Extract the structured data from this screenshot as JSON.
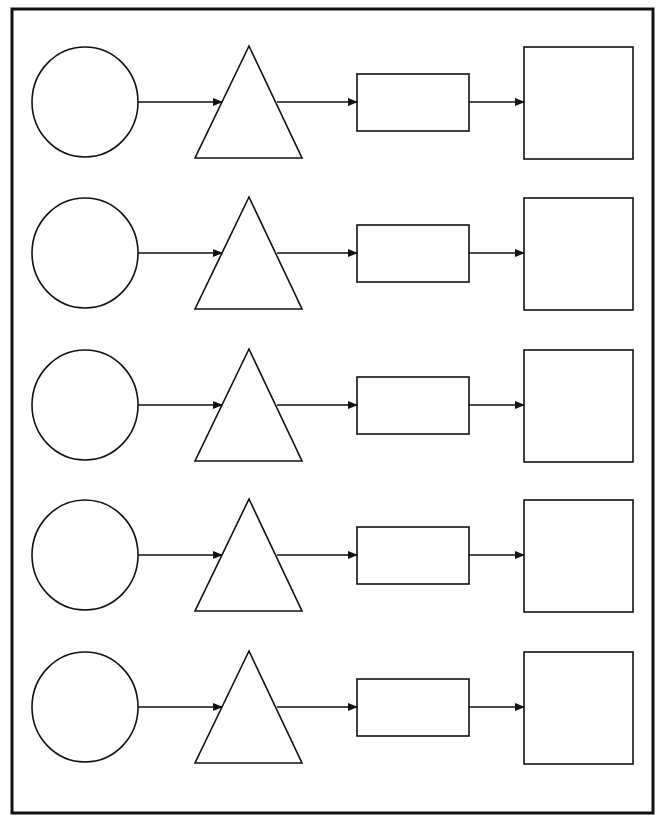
{
  "diagram": {
    "title": "",
    "colors": {
      "stroke": "#111111",
      "background": "#ffffff"
    },
    "border": {
      "x": 12,
      "y": 9,
      "width": 641,
      "height": 804
    },
    "row_centers_y": [
      102,
      253,
      405,
      555,
      707
    ],
    "shapes_per_row": [
      "circle",
      "triangle",
      "rectangle",
      "square"
    ],
    "rows": [
      {
        "sequence": "circle → triangle → rectangle → square"
      },
      {
        "sequence": "circle → triangle → rectangle → square"
      },
      {
        "sequence": "circle → triangle → rectangle → square"
      },
      {
        "sequence": "circle → triangle → rectangle → square"
      },
      {
        "sequence": "circle → triangle → rectangle → square"
      }
    ]
  }
}
